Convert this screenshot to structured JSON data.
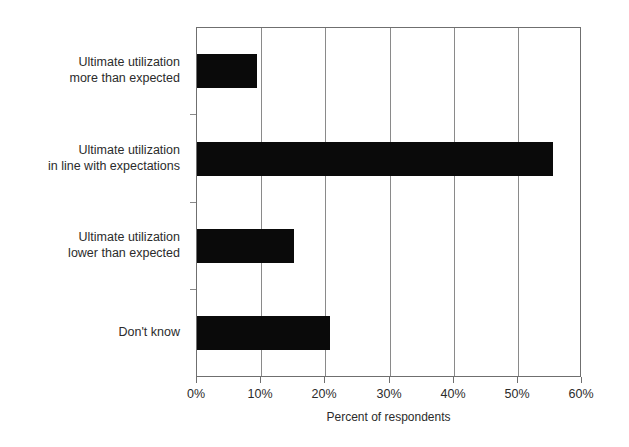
{
  "chart_data": {
    "type": "bar",
    "orientation": "horizontal",
    "title": "",
    "subtitle": "",
    "xlabel": "Percent of respondents",
    "ylabel": "",
    "categories": [
      "Ultimate utilization\nmore than expected",
      "Ultimate utilization\nin line with expectations",
      "Ultimate utilization\nlower than expected",
      "Don't know"
    ],
    "values": [
      9.3,
      55.5,
      15.1,
      20.7
    ],
    "xlim": [
      0,
      60
    ],
    "xticks": [
      0,
      10,
      20,
      30,
      40,
      50,
      60
    ],
    "xticklabels": [
      "0%",
      "10%",
      "20%",
      "30%",
      "40%",
      "50%",
      "60%"
    ],
    "grid": "vertical",
    "legend": "none",
    "bar_color": "#0a0a0a",
    "axis_color": "#6f6f6f",
    "grid_color": "#8a8a8a",
    "background": "#ffffff"
  }
}
